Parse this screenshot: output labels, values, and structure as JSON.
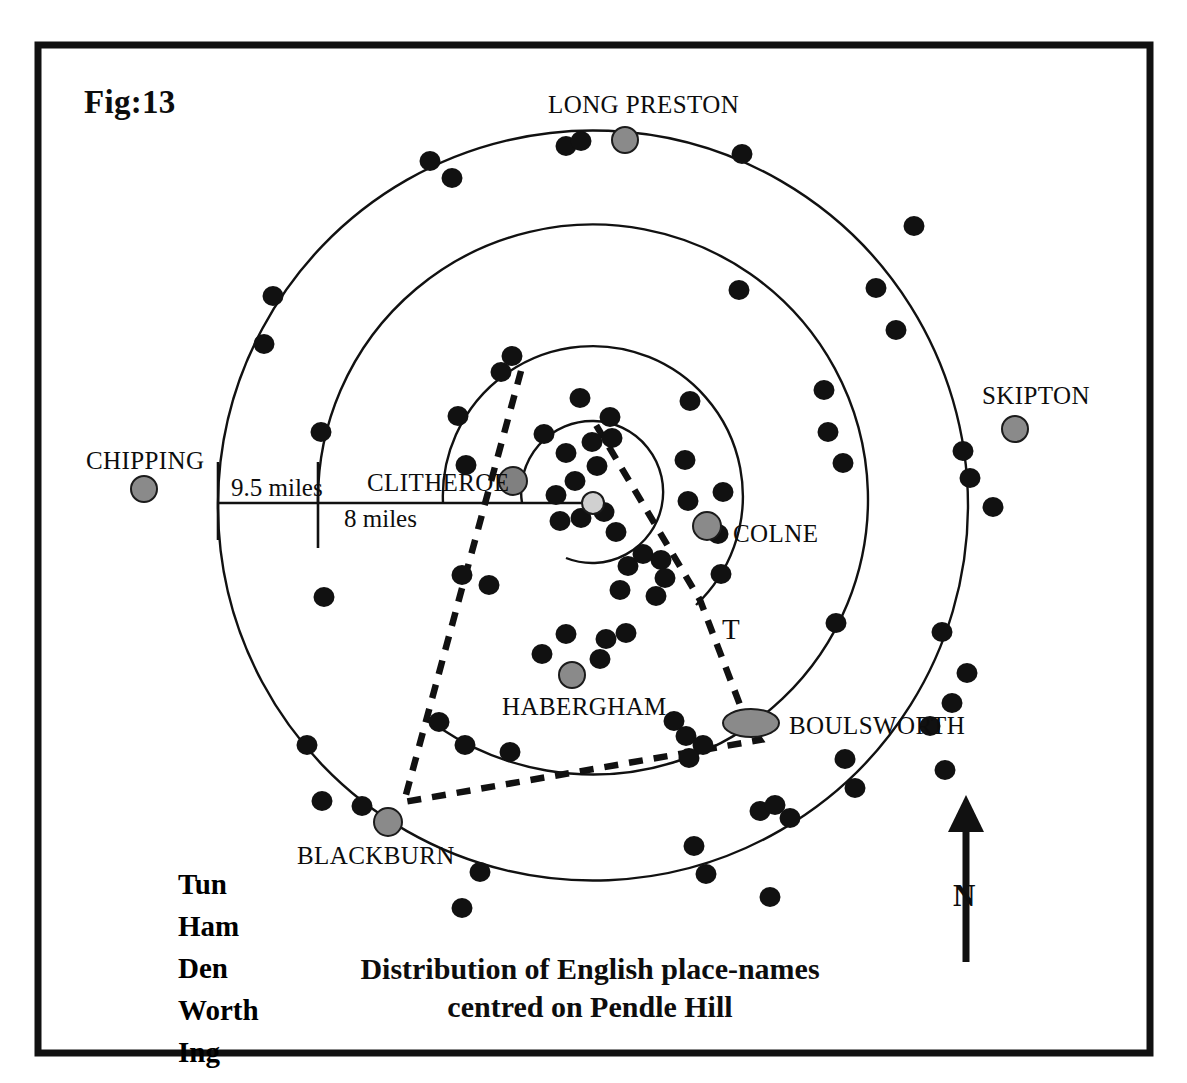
{
  "figure": {
    "number_label": "Fig:13",
    "caption_line1": "Distribution of English place-names",
    "caption_line2": "centred on Pendle Hill",
    "frame_color": "#111111",
    "background": "#ffffff"
  },
  "legend": {
    "items": [
      {
        "label": "Tun"
      },
      {
        "label": "Ham"
      },
      {
        "label": "Den"
      },
      {
        "label": "Worth"
      },
      {
        "label": "Ing"
      }
    ]
  },
  "compass": {
    "label": "N",
    "direction": "up"
  },
  "scale_rings": {
    "labels": [
      {
        "text": "9.5 miles"
      },
      {
        "text": "8 miles"
      }
    ],
    "ring_radii_px": [
      375,
      275,
      150,
      71
    ],
    "center_px": {
      "x": 593,
      "y": 503
    }
  },
  "annotations": {
    "territory_marker": "T"
  },
  "colors": {
    "dot_black": "#111111",
    "settlement_gray": "#808080",
    "center_gray": "#d0d0d0",
    "line_black": "#111111"
  },
  "settlements": [
    {
      "name": "LONG PRESTON",
      "x": 625,
      "y": 140,
      "r": 13,
      "label_x": 548,
      "label_y": 92,
      "fill": "#8a8a8a"
    },
    {
      "name": "SKIPTON",
      "x": 1015,
      "y": 429,
      "r": 13,
      "label_x": 982,
      "label_y": 383,
      "fill": "#8a8a8a"
    },
    {
      "name": "CHIPPING",
      "x": 144,
      "y": 489,
      "r": 13,
      "label_x": 86,
      "label_y": 448,
      "fill": "#8a8a8a"
    },
    {
      "name": "CLITHEROE",
      "x": 513,
      "y": 481,
      "r": 14,
      "label_x": 367,
      "label_y": 470,
      "fill": "#808080"
    },
    {
      "name": "COLNE",
      "x": 707,
      "y": 526,
      "r": 14,
      "label_x": 733,
      "label_y": 521,
      "fill": "#8a8a8a"
    },
    {
      "name": "HABERGHAM",
      "x": 572,
      "y": 675,
      "r": 13,
      "label_x": 502,
      "label_y": 694,
      "fill": "#8a8a8a"
    },
    {
      "name": "BOULSWORTH",
      "x": 751,
      "y": 723,
      "rx": 28,
      "ry": 14,
      "label_x": 789,
      "label_y": 713,
      "fill": "#8a8a8a"
    },
    {
      "name": "BLACKBURN",
      "x": 388,
      "y": 822,
      "r": 14,
      "label_x": 297,
      "label_y": 843,
      "fill": "#8a8a8a"
    }
  ],
  "chart_data": {
    "type": "scatter",
    "title": "Distribution of English place-names centred on Pendle Hill",
    "legend_categories": [
      "Tun",
      "Ham",
      "Den",
      "Worth",
      "Ing"
    ],
    "center": {
      "x": 593,
      "y": 503
    },
    "rings": [
      {
        "radius_px": 375,
        "label": "9.5 miles"
      },
      {
        "radius_px": 275,
        "label": "8 miles"
      },
      {
        "radius_px": 150,
        "label": ""
      },
      {
        "radius_px": 71,
        "label": ""
      }
    ],
    "place_name_points": [
      [
        430,
        161
      ],
      [
        452,
        178
      ],
      [
        566,
        146
      ],
      [
        581,
        141
      ],
      [
        625,
        141
      ],
      [
        742,
        154
      ],
      [
        914,
        226
      ],
      [
        273,
        296
      ],
      [
        264,
        344
      ],
      [
        321,
        432
      ],
      [
        876,
        288
      ],
      [
        896,
        330
      ],
      [
        963,
        451
      ],
      [
        970,
        478
      ],
      [
        993,
        507
      ],
      [
        739,
        290
      ],
      [
        690,
        401
      ],
      [
        824,
        390
      ],
      [
        828,
        432
      ],
      [
        843,
        463
      ],
      [
        512,
        356
      ],
      [
        501,
        372
      ],
      [
        458,
        416
      ],
      [
        466,
        465
      ],
      [
        544,
        434
      ],
      [
        566,
        453
      ],
      [
        592,
        442
      ],
      [
        612,
        438
      ],
      [
        597,
        466
      ],
      [
        575,
        481
      ],
      [
        556,
        495
      ],
      [
        560,
        521
      ],
      [
        581,
        518
      ],
      [
        604,
        512
      ],
      [
        616,
        532
      ],
      [
        628,
        566
      ],
      [
        643,
        554
      ],
      [
        620,
        590
      ],
      [
        661,
        560
      ],
      [
        665,
        578
      ],
      [
        656,
        596
      ],
      [
        688,
        501
      ],
      [
        723,
        492
      ],
      [
        718,
        534
      ],
      [
        721,
        574
      ],
      [
        685,
        460
      ],
      [
        580,
        398
      ],
      [
        610,
        417
      ],
      [
        462,
        575
      ],
      [
        489,
        585
      ],
      [
        324,
        597
      ],
      [
        439,
        722
      ],
      [
        465,
        745
      ],
      [
        510,
        752
      ],
      [
        542,
        654
      ],
      [
        566,
        634
      ],
      [
        606,
        639
      ],
      [
        626,
        633
      ],
      [
        600,
        659
      ],
      [
        572,
        672
      ],
      [
        674,
        721
      ],
      [
        686,
        736
      ],
      [
        703,
        745
      ],
      [
        689,
        758
      ],
      [
        845,
        759
      ],
      [
        855,
        788
      ],
      [
        836,
        623
      ],
      [
        322,
        801
      ],
      [
        362,
        806
      ],
      [
        480,
        872
      ],
      [
        462,
        908
      ],
      [
        694,
        846
      ],
      [
        760,
        811
      ],
      [
        775,
        805
      ],
      [
        790,
        818
      ],
      [
        706,
        874
      ],
      [
        770,
        897
      ],
      [
        942,
        632
      ],
      [
        952,
        703
      ],
      [
        967,
        673
      ],
      [
        930,
        726
      ],
      [
        307,
        745
      ],
      [
        945,
        770
      ]
    ],
    "dashed_boundary": [
      [
        521,
        371
      ],
      [
        404,
        802
      ],
      [
        760,
        740
      ],
      [
        745,
        718
      ],
      [
        700,
        600
      ],
      [
        593,
        420
      ]
    ]
  }
}
